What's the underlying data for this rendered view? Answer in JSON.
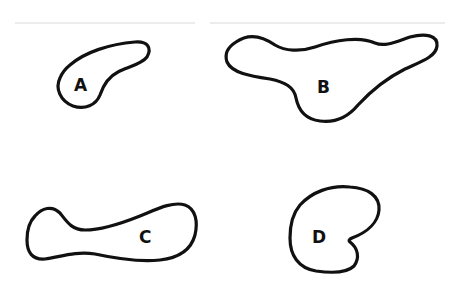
{
  "diagram": {
    "shapes": [
      {
        "id": "A",
        "label": "A",
        "position": "top-left"
      },
      {
        "id": "B",
        "label": "B",
        "position": "top-right"
      },
      {
        "id": "C",
        "label": "C",
        "position": "bottom-left"
      },
      {
        "id": "D",
        "label": "D",
        "position": "bottom-right"
      }
    ],
    "colors": {
      "stroke": "#111111",
      "background": "#ffffff"
    }
  }
}
